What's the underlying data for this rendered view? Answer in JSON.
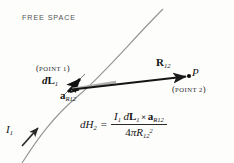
{
  "figure": {
    "background_color": "#fdfdfc",
    "ink_color": "#1a1a1a",
    "curve_color": "#8a8a8a",
    "labels": {
      "free_space": "FREE SPACE",
      "point1_open_paren": "(",
      "point1_text": "POINT 1",
      "point1_close_paren": ")",
      "point2_open_paren": "(",
      "point2_text": "POINT 2",
      "point2_close_paren": ")",
      "dl1_d": "d",
      "dl1_L": "L",
      "dl1_sub": "1",
      "a_r12_a": "a",
      "a_r12_sub": "R12",
      "r12_R": "R",
      "r12_sub": "12",
      "point_p": "P",
      "current_I": "I",
      "current_sub": "1"
    },
    "formula": {
      "lhs_d": "d",
      "lhs_H": "H",
      "lhs_sub": "2",
      "equals": "=",
      "num_I": "I",
      "num_I_sub": "1",
      "num_d": "d",
      "num_L": "L",
      "num_L_sub": "1",
      "cross": "×",
      "num_a": "a",
      "num_a_sub": "R12",
      "den_four": "4",
      "den_pi": "π",
      "den_R": "R",
      "den_R_sub": "12",
      "den_R_sup": "2"
    }
  }
}
